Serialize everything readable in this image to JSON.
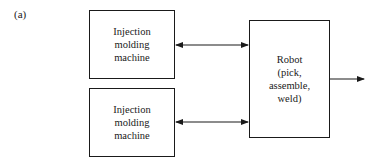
{
  "figure": {
    "label": "(a)"
  },
  "nodes": {
    "machine_top": {
      "lines": [
        "Injection",
        "molding",
        "machine"
      ]
    },
    "machine_bottom": {
      "lines": [
        "Injection",
        "molding",
        "machine"
      ]
    },
    "robot": {
      "lines": [
        "Robot",
        "(pick,",
        "assemble,",
        "weld)"
      ]
    }
  },
  "edges": [
    {
      "from": "machine_top",
      "to": "robot",
      "type": "bidirectional"
    },
    {
      "from": "machine_bottom",
      "to": "robot",
      "type": "bidirectional"
    },
    {
      "from": "robot",
      "to": "output",
      "type": "directed"
    }
  ],
  "colors": {
    "stroke": "#1a1a1a",
    "background": "#ffffff"
  }
}
